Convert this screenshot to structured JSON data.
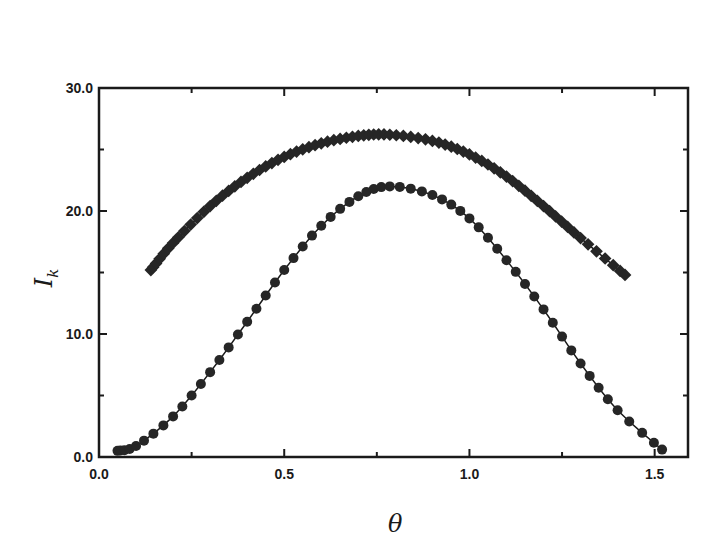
{
  "chart_data": {
    "type": "scatter",
    "title": "",
    "xlabel": "θ",
    "ylabel": "I_k",
    "ylabel_main": "I",
    "ylabel_sub": "k",
    "xlim": [
      0.0,
      1.59
    ],
    "ylim": [
      0.0,
      30.0
    ],
    "grid": false,
    "legend": null,
    "x_ticks": [
      0.0,
      0.5,
      1.0,
      1.5
    ],
    "x_tick_labels": [
      "0.0",
      "0.5",
      "1.0",
      "1.5"
    ],
    "y_ticks": [
      0.0,
      10.0,
      20.0,
      30.0
    ],
    "y_tick_labels": [
      "0.0",
      "10.0",
      "20.0",
      "30.0"
    ],
    "series": [
      {
        "name": "upper (square markers)",
        "marker": "square",
        "connected": true,
        "x": [
          0.14,
          0.2,
          0.3,
          0.4,
          0.5,
          0.6,
          0.7,
          0.785,
          0.9,
          1.0,
          1.1,
          1.2,
          1.3,
          1.42
        ],
        "y": [
          15.2,
          17.4,
          20.4,
          22.7,
          24.4,
          25.5,
          26.1,
          26.2,
          25.7,
          24.6,
          22.8,
          20.4,
          17.8,
          14.8
        ]
      },
      {
        "name": "lower (circle markers)",
        "marker": "circle",
        "connected": true,
        "x": [
          0.05,
          0.1,
          0.2,
          0.3,
          0.4,
          0.5,
          0.6,
          0.7,
          0.785,
          0.9,
          1.0,
          1.1,
          1.2,
          1.3,
          1.4,
          1.52
        ],
        "y": [
          0.5,
          0.9,
          3.3,
          6.9,
          11.0,
          15.2,
          18.8,
          21.2,
          22.0,
          21.3,
          19.4,
          16.0,
          12.0,
          7.6,
          3.8,
          0.6
        ]
      }
    ]
  }
}
